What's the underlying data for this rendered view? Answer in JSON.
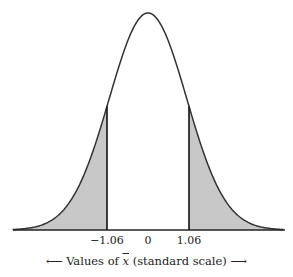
{
  "chart_data": {
    "type": "area",
    "title": "",
    "x_range": [
      -3.5,
      3.5
    ],
    "tick_labels": [
      "-1.06",
      "0",
      "1.06"
    ],
    "tick_values": [
      -1.06,
      0,
      1.06
    ],
    "shaded_regions": [
      {
        "from": -3.5,
        "to": -1.06,
        "label": "left tail"
      },
      {
        "from": 1.06,
        "to": 3.5,
        "label": "right tail"
      }
    ],
    "cutoffs": [
      -1.06,
      1.06
    ],
    "xlabel": "Values of x̄ (standard scale)",
    "ylabel": "",
    "grid": false,
    "colors": {
      "curve": "#333333",
      "shade": "#c8c8c8",
      "axis": "#222222"
    }
  },
  "labels": {
    "tick_left": "−1.06",
    "tick_center": "0",
    "tick_right": "1.06",
    "xlabel_prefix": "Values of ",
    "xlabel_var": "x",
    "xlabel_suffix": " (standard scale)",
    "arrow_left": "⟵",
    "arrow_right": "⟶"
  }
}
